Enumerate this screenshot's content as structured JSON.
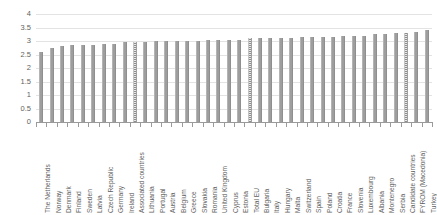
{
  "chart_data": {
    "type": "bar",
    "title": "",
    "subtitle": "",
    "xlabel": "",
    "ylabel": "",
    "ylim": [
      0,
      4
    ],
    "ytick_step": 0.5,
    "ytick_labels": [
      "4",
      "3.5",
      "3",
      "2.5",
      "2",
      "1.5",
      "1",
      "0.5",
      "0"
    ],
    "ytick_values": [
      4,
      3.5,
      3,
      2.5,
      2,
      1.5,
      1,
      0.5,
      0
    ],
    "grid": true,
    "legend": false,
    "legend_position": "none",
    "bar_color": "#9e9e9e",
    "aggregate_bar_color": "#bdbdbd",
    "gridline_color": "#e3e3e3",
    "axis_color": "#9a9a9a",
    "text_color": "#5f5f5f",
    "categories": [
      "The Netherlands",
      "Norway",
      "Denmark",
      "Finland",
      "Sweden",
      "Latvia",
      "Czech Republic",
      "Germany",
      "Ireland",
      "Associated countries",
      "Lithuania",
      "Portugal",
      "Austria",
      "Belgium",
      "Greece",
      "Slovakia",
      "Romania",
      "United Kingdom",
      "Cyprus",
      "Estonia",
      "Total EU",
      "Bulgaria",
      "Italy",
      "Hungary",
      "Malta",
      "Switzerland",
      "Spain",
      "Poland",
      "Croatia",
      "France",
      "Slovenia",
      "Luxembourg",
      "Albania",
      "Montenegro",
      "Serbia",
      "Candidate countries",
      "FYROM (Macedonia)",
      "Turkey"
    ],
    "values": [
      2.6,
      2.75,
      2.8,
      2.85,
      2.85,
      2.85,
      2.9,
      2.9,
      2.95,
      2.95,
      2.95,
      3.0,
      3.0,
      3.0,
      3.0,
      3.0,
      3.05,
      3.05,
      3.05,
      3.05,
      3.1,
      3.1,
      3.1,
      3.1,
      3.1,
      3.15,
      3.15,
      3.15,
      3.15,
      3.2,
      3.2,
      3.2,
      3.25,
      3.25,
      3.3,
      3.3,
      3.35,
      3.4
    ],
    "aggregate_categories": [
      "Associated countries",
      "Total EU",
      "Candidate countries"
    ]
  }
}
